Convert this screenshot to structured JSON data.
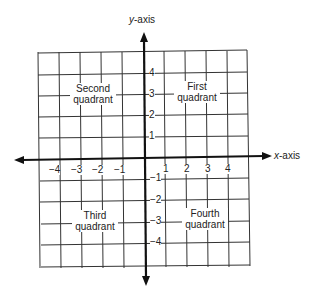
{
  "diagram": {
    "type": "cartesian-coordinate-plane",
    "x_axis_label": {
      "var": "x",
      "suffix": "-axis"
    },
    "y_axis_label": {
      "var": "y",
      "suffix": "-axis"
    },
    "x_ticks_negative": [
      "−4",
      "−3",
      "−2",
      "−1"
    ],
    "x_ticks_positive": [
      "1",
      "2",
      "3",
      "4"
    ],
    "y_ticks_positive": [
      "4",
      "3",
      "2",
      "1"
    ],
    "y_ticks_negative": [
      "−1",
      "−2",
      "−3",
      "−4"
    ],
    "quadrants": {
      "first": {
        "line1": "First",
        "line2": "quadrant"
      },
      "second": {
        "line1": "Second",
        "line2": "quadrant"
      },
      "third": {
        "line1": "Third",
        "line2": "quadrant"
      },
      "fourth": {
        "line1": "Fourth",
        "line2": "quadrant"
      }
    },
    "grid": {
      "cells_x": 10,
      "cells_y": 10
    },
    "colors": {
      "lines": "#222222",
      "background": "#ffffff"
    }
  }
}
